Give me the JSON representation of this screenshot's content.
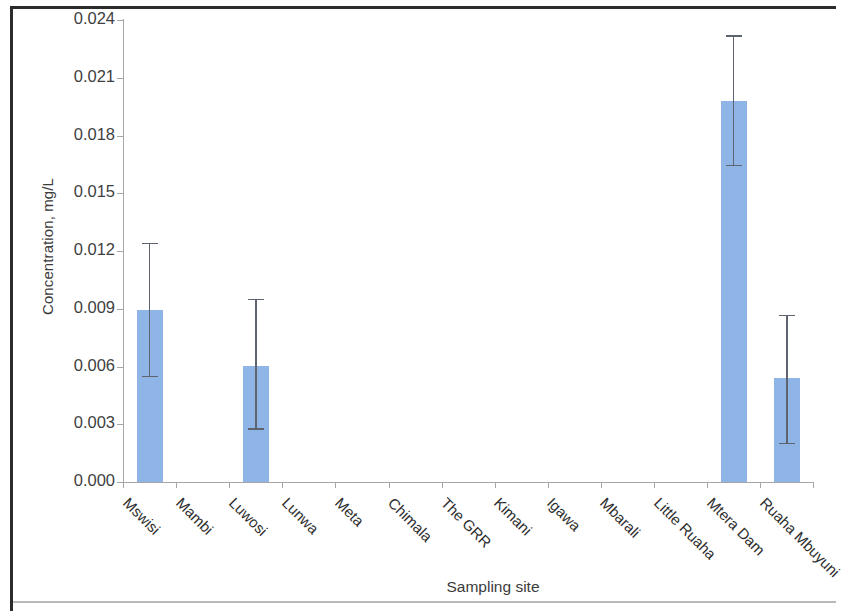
{
  "chart_data": {
    "type": "bar",
    "title": "",
    "xlabel": "Sampling site",
    "ylabel": "Concentration, mg/L",
    "categories": [
      "Mswisi",
      "Mambi",
      "Luwosi",
      "Lunwa",
      "Meta",
      "Chimala",
      "The GRR",
      "Kimani",
      "Igawa",
      "Mbarali",
      "Little Ruaha",
      "Mtera Dam",
      "Ruaha Mbuyuni"
    ],
    "values": [
      0.00894,
      0.0,
      0.00603,
      0.0,
      0.0,
      0.0,
      0.0,
      0.0,
      0.0,
      0.0,
      0.0,
      0.01979,
      0.00541
    ],
    "error_low": [
      0.00551,
      0.0,
      0.0028,
      0.0,
      0.0,
      0.0,
      0.0,
      0.0,
      0.0,
      0.0,
      0.0,
      0.01647,
      0.00203
    ],
    "error_high": [
      0.01242,
      0.0,
      0.00951,
      0.0,
      0.0,
      0.0,
      0.0,
      0.0,
      0.0,
      0.0,
      0.0,
      0.02322,
      0.00868
    ],
    "ylim": [
      0.0,
      0.024
    ],
    "ytick_values": [
      0.0,
      0.003,
      0.006,
      0.009,
      0.012,
      0.015,
      0.018,
      0.021,
      0.024
    ],
    "ytick_labels": [
      "0.000",
      "0.003",
      "0.006",
      "0.009",
      "0.012",
      "0.015",
      "0.018",
      "0.021",
      "0.024"
    ],
    "grid": false,
    "legend": "none",
    "bar_color": "#8FB5E6",
    "error_bar_color": "#5D6470",
    "axis_color": "#A6A6A6",
    "tick_label_rotation": 45
  }
}
